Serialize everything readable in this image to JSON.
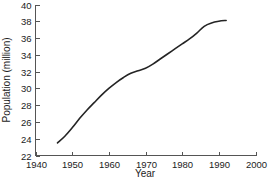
{
  "chart_data": {
    "type": "line",
    "title": "",
    "subtitle": "",
    "xlabel": "Year",
    "ylabel": "Population (million)",
    "xlim": [
      1940,
      2000
    ],
    "ylim": [
      22,
      40
    ],
    "xticks": [
      1940,
      1950,
      1960,
      1970,
      1980,
      1990,
      2000
    ],
    "xtick_labels": [
      "1940",
      "1950",
      "1960",
      "1970",
      "1980",
      "1990",
      "2000"
    ],
    "yticks": [
      22,
      24,
      26,
      28,
      30,
      32,
      34,
      36,
      38,
      40
    ],
    "ytick_labels": [
      "22",
      "24",
      "26",
      "28",
      "30",
      "32",
      "34",
      "36",
      "38",
      "40"
    ],
    "grid": false,
    "legend": false,
    "legend_position": "none",
    "annotations": [],
    "line_color": "#242424",
    "axis_color": "#555555",
    "background_color": "#ffffff",
    "series": [
      {
        "name": "Population",
        "x": [
          1946,
          1948,
          1950,
          1952,
          1954,
          1956,
          1958,
          1960,
          1962,
          1964,
          1966,
          1968,
          1970,
          1972,
          1974,
          1976,
          1978,
          1980,
          1982,
          1984,
          1986,
          1988,
          1990,
          1992
        ],
        "values": [
          23.5,
          24.3,
          25.3,
          26.4,
          27.4,
          28.3,
          29.2,
          30.0,
          30.7,
          31.3,
          31.8,
          32.1,
          32.4,
          32.9,
          33.5,
          34.1,
          34.7,
          35.3,
          35.9,
          36.6,
          37.4,
          37.8,
          38.0,
          38.1
        ]
      }
    ]
  },
  "figure": {
    "x_axis_title": "Year",
    "y_axis_title": "Population (million)"
  }
}
